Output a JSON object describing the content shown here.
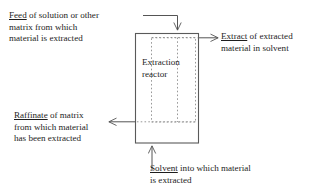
{
  "diagram": {
    "type": "process-flow",
    "background_color": "#ffffff",
    "line_color": "#555555",
    "text_color": "#1d1d1d"
  },
  "reactor": {
    "label_line1": "Extraction",
    "label_line2": "reactor"
  },
  "streams": {
    "feed": {
      "term": "Feed",
      "line1_rest": " of solution or other",
      "line2": "matrix from which",
      "line3": "material is extracted"
    },
    "extract": {
      "term": "Extract",
      "line1_rest": " of extracted",
      "line2": "material in solvent"
    },
    "raffinate": {
      "term": "Raffinate",
      "line1_rest": " of matrix",
      "line2": "from which material",
      "line3": "has been extracted"
    },
    "solvent": {
      "term": "Solvent",
      "line1_rest": " into which material",
      "line2": "is extracted"
    }
  }
}
